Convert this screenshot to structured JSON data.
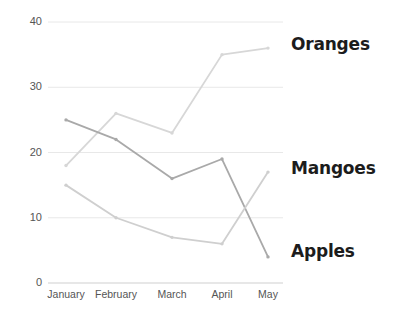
{
  "chart_data": {
    "type": "line",
    "title": "",
    "xlabel": "",
    "ylabel": "",
    "categories": [
      "January",
      "February",
      "March",
      "April",
      "May"
    ],
    "series": [
      {
        "name": "Oranges",
        "values": [
          18,
          26,
          23,
          35,
          36
        ],
        "color": "#d7d7d7"
      },
      {
        "name": "Mangoes",
        "values": [
          25,
          22,
          16,
          19,
          4
        ],
        "color": "#a9a9a9"
      },
      {
        "name": "Apples",
        "values": [
          15,
          10,
          7,
          6,
          17
        ],
        "color": "#cfcfcf"
      }
    ],
    "ylim": [
      0,
      40
    ],
    "yticks": [
      0,
      10,
      20,
      30,
      40
    ],
    "ytick_labels": [
      "0",
      "10",
      "20",
      "30",
      "40"
    ],
    "grid": true,
    "grid_color": "#e8e8e8",
    "legend_position": "right-inline",
    "markers": true
  },
  "axis": {
    "y_labels": [
      "40",
      "30",
      "20",
      "10",
      "0"
    ],
    "x_labels": [
      "January",
      "February",
      "March",
      "April",
      "May"
    ]
  },
  "legend": {
    "items": [
      {
        "label": "Oranges"
      },
      {
        "label": "Mangoes"
      },
      {
        "label": "Apples"
      }
    ]
  },
  "colors": {
    "background": "#ffffff",
    "grid": "#e8e8e8",
    "tick_text": "#555555",
    "legend_text": "#1c1c1c"
  }
}
